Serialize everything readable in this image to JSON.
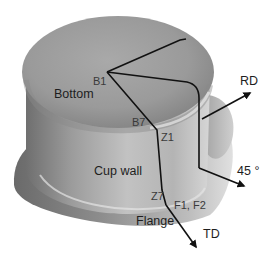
{
  "figure": {
    "regions": {
      "bottom": "Bottom",
      "cup_wall": "Cup wall",
      "flange": "Flange"
    },
    "points": {
      "b1": "B1",
      "b7": "B7",
      "z1": "Z1",
      "z7": "Z7",
      "f1f2": "F1, F2"
    },
    "directions": {
      "rd": "RD",
      "deg45": "45 °",
      "td": "TD"
    },
    "colors": {
      "path_line": "#111111",
      "label_text": "#3a3a3a",
      "cup_metal": "#9a9a9a"
    }
  }
}
